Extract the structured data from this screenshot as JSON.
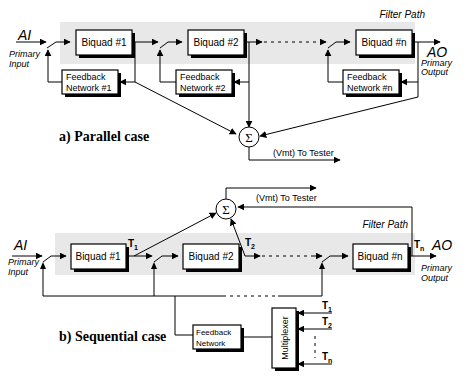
{
  "diagram": {
    "parallel": {
      "caption": "a) Parallel case",
      "filter_path_label": "Filter Path",
      "input": {
        "signal": "AI",
        "label_line1": "Primary",
        "label_line2": "Input"
      },
      "output": {
        "signal": "AO",
        "label_line1": "Primary",
        "label_line2": "Output"
      },
      "biquads": [
        "Biquad #1",
        "Biquad #2",
        "Biquad #n"
      ],
      "feedback_networks": [
        {
          "line1": "Feedback",
          "line2": "Network #1"
        },
        {
          "line1": "Feedback",
          "line2": "Network #2"
        },
        {
          "line1": "Feedback",
          "line2": "Network #n"
        }
      ],
      "summer_symbol": "Σ",
      "tester_label": "(Vmt) To Tester"
    },
    "sequential": {
      "caption": "b) Sequential case",
      "filter_path_label": "Filter Path",
      "input": {
        "signal": "AI",
        "label_line1": "Primary",
        "label_line2": "Input"
      },
      "output": {
        "signal": "AO",
        "label_line1": "Primary",
        "label_line2": "Output"
      },
      "biquads": [
        "Biquad #1",
        "Biquad #2",
        "Biquad #n"
      ],
      "taps": [
        "T1",
        "T2",
        "Tn"
      ],
      "tap_letter": "T",
      "tap_subs": [
        "1",
        "2",
        "n"
      ],
      "feedback_network": {
        "line1": "Feedback",
        "line2": "Network"
      },
      "multiplexer_label": "Multiplexer",
      "summer_symbol": "Σ",
      "tester_label": "(Vmt) To Tester"
    }
  }
}
